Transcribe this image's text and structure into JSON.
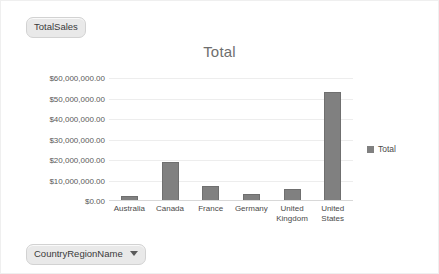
{
  "fields": {
    "measure_pill": "TotalSales",
    "axis_pill": "CountryRegionName",
    "caret_icon": "chevron-down-icon"
  },
  "legend": {
    "position": "right",
    "entries": [
      {
        "label": "Total",
        "color": "#808080"
      }
    ]
  },
  "colors": {
    "bar": "#808080",
    "bar_border": "#6f6f6f",
    "gridline": "#ededed",
    "baseline": "#d8d8d8",
    "title_text": "#6e6e6e",
    "pill_fill": "#e9e9e9",
    "pill_border": "#d2d2d2"
  },
  "chart_data": {
    "type": "bar",
    "title": "Total",
    "xlabel": "",
    "ylabel": "",
    "grid": true,
    "legend_position": "right",
    "ylim": [
      0,
      60000000
    ],
    "ytick_labels": [
      "$60,000,000.00",
      "$50,000,000.00",
      "$40,000,000.00",
      "$30,000,000.00",
      "$20,000,000.00",
      "$10,000,000.00",
      "$0.00"
    ],
    "ytick_values": [
      60000000,
      50000000,
      40000000,
      30000000,
      20000000,
      10000000,
      0
    ],
    "categories": [
      "Australia",
      "Canada",
      "France",
      "Germany",
      "United Kingdom",
      "United States"
    ],
    "category_lines": [
      [
        "Australia"
      ],
      [
        "Canada"
      ],
      [
        "France"
      ],
      [
        "Germany"
      ],
      [
        "United",
        "Kingdom"
      ],
      [
        "United",
        "States"
      ]
    ],
    "series": [
      {
        "name": "Total",
        "color": "#808080",
        "values": [
          2500000,
          19000000,
          7500000,
          3500000,
          6000000,
          53000000
        ]
      }
    ]
  }
}
